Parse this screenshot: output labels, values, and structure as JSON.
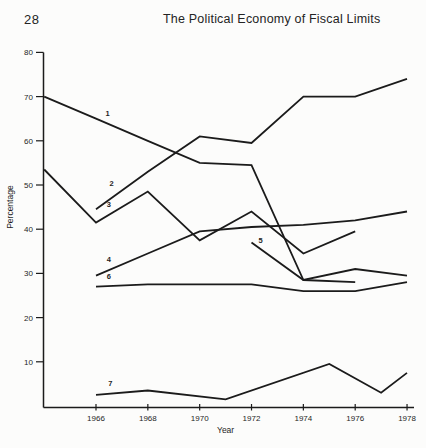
{
  "header": {
    "page_number": "28",
    "title": "The Political Economy of Fiscal Limits"
  },
  "chart_data": {
    "type": "line",
    "title": "",
    "xlabel": "Year",
    "ylabel": "Percentage",
    "x_ticks": [
      1966,
      1968,
      1970,
      1972,
      1974,
      1976,
      1978
    ],
    "y_ticks": [
      10,
      20,
      30,
      40,
      50,
      60,
      70,
      80
    ],
    "xlim": [
      1964,
      1978.3
    ],
    "ylim": [
      0,
      80
    ],
    "grid": false,
    "legend": "series numbered 1-7 labeled inline on lines",
    "line_color": "#1b1b1b",
    "series": [
      {
        "name": "1",
        "points": [
          [
            1964,
            70
          ],
          [
            1966,
            65
          ],
          [
            1968,
            60
          ],
          [
            1970,
            55
          ],
          [
            1972,
            54.5
          ],
          [
            1974,
            28.5
          ],
          [
            1976,
            31
          ],
          [
            1978,
            29.5
          ]
        ],
        "label_at": [
          1966.45,
          65.6
        ]
      },
      {
        "name": "2",
        "points": [
          [
            1966,
            44.5
          ],
          [
            1968,
            53
          ],
          [
            1970,
            61
          ],
          [
            1972,
            59.5
          ],
          [
            1974,
            70
          ],
          [
            1976,
            70
          ],
          [
            1978,
            74
          ]
        ],
        "label_at": [
          1966.6,
          49.8
        ]
      },
      {
        "name": "3",
        "points": [
          [
            1964,
            53.5
          ],
          [
            1966,
            41.5
          ],
          [
            1968,
            48.5
          ],
          [
            1970,
            37.5
          ],
          [
            1972,
            44
          ],
          [
            1974,
            34.5
          ],
          [
            1976,
            39.5
          ]
        ],
        "label_at": [
          1966.5,
          45.0
        ]
      },
      {
        "name": "4",
        "points": [
          [
            1966,
            29.5
          ],
          [
            1968,
            34.5
          ],
          [
            1970,
            39.5
          ],
          [
            1972,
            40.5
          ],
          [
            1974,
            41
          ],
          [
            1976,
            42
          ],
          [
            1978,
            44
          ]
        ],
        "label_at": [
          1966.5,
          32.6
        ]
      },
      {
        "name": "5",
        "points": [
          [
            1972,
            37
          ],
          [
            1974,
            28.5
          ],
          [
            1976,
            28
          ]
        ],
        "label_at": [
          1972.35,
          36.9
        ]
      },
      {
        "name": "6",
        "points": [
          [
            1966,
            27
          ],
          [
            1968,
            27.5
          ],
          [
            1970,
            27.5
          ],
          [
            1972,
            27.5
          ],
          [
            1974,
            26
          ],
          [
            1976,
            26
          ],
          [
            1978,
            28
          ]
        ],
        "label_at": [
          1966.5,
          28.8
        ]
      },
      {
        "name": "7",
        "points": [
          [
            1966,
            2.5
          ],
          [
            1968,
            3.5
          ],
          [
            1971,
            1.5
          ],
          [
            1975,
            9.5
          ],
          [
            1977,
            3
          ],
          [
            1978,
            7.5
          ]
        ],
        "label_at": [
          1966.55,
          4.6
        ]
      }
    ]
  }
}
